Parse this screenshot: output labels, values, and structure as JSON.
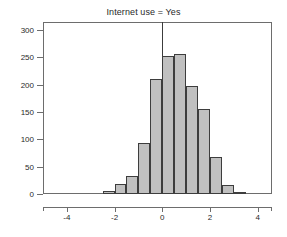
{
  "chart_data": {
    "type": "bar",
    "title": "Internet use = Yes",
    "xlabel": "",
    "ylabel": "",
    "xlim": [
      -5.0,
      4.6
    ],
    "ylim": [
      0,
      315
    ],
    "grid": false,
    "legend": null,
    "bin_width": 0.5,
    "reference_line_x": 0,
    "bar_fill_color": "#c0c0c0",
    "bar_edge_color": "#3d3d3d",
    "axis_color": "#6d6d6d",
    "text_color": "#2a2a2a",
    "background_color": "#ffffff",
    "xticks": [
      -4,
      -2,
      0,
      2,
      4
    ],
    "xtick_labels": [
      "-4",
      "-2",
      "0",
      "2",
      "4"
    ],
    "yticks": [
      0,
      50,
      100,
      150,
      200,
      250,
      300
    ],
    "ytick_labels": [
      "0",
      "50",
      "100",
      "150",
      "200",
      "250",
      "300"
    ],
    "bin_centers": [
      -2.25,
      -1.75,
      -1.25,
      -0.75,
      -0.25,
      0.25,
      0.75,
      1.25,
      1.75,
      2.25,
      2.75,
      3.25
    ],
    "bin_edges": [
      -2.5,
      -2.0,
      -1.5,
      -1.0,
      -0.5,
      0.0,
      0.5,
      1.0,
      1.5,
      2.0,
      2.5,
      3.0,
      3.5
    ],
    "categories": [
      "-2.5 to -2.0",
      "-2.0 to -1.5",
      "-1.5 to -1.0",
      "-1.0 to -0.5",
      "-0.5 to 0.0",
      "0.0 to 0.5",
      "0.5 to 1.0",
      "1.0 to 1.5",
      "1.5 to 2.0",
      "2.0 to 2.5",
      "2.5 to 3.0",
      "3.0 to 3.5"
    ],
    "values": [
      6,
      19,
      33,
      93,
      210,
      253,
      257,
      198,
      155,
      67,
      16,
      2
    ]
  }
}
